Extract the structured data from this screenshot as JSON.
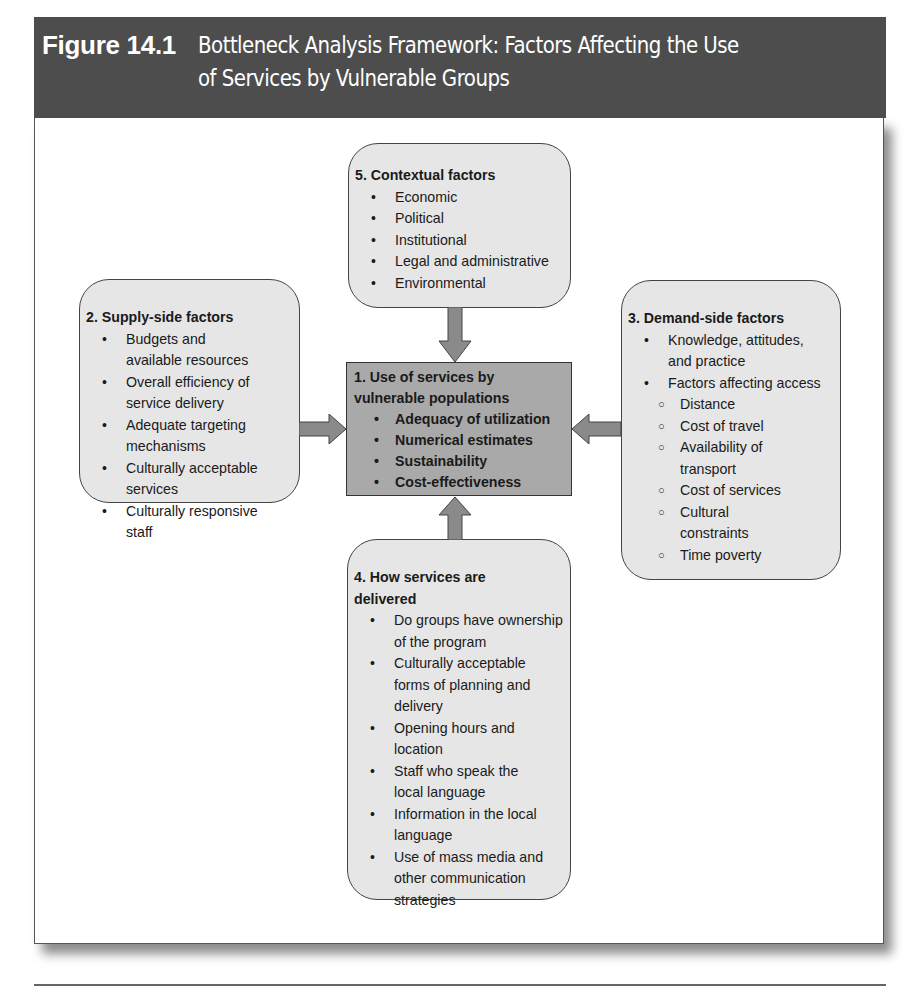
{
  "figure": {
    "label": "Figure 14.1",
    "title": "Bottleneck Analysis Framework: Factors Affecting the Use of Services by Vulnerable Groups",
    "title_line1": "Bottleneck Analysis Framework: Factors Affecting the Use",
    "title_line2": "of Services by Vulnerable Groups",
    "colors": {
      "header_bg": "#4d4d4d",
      "box_bg": "#e6e6e6",
      "center_bg": "#a9a9a9",
      "arrow_fill": "#8a8a8a",
      "border": "#444444"
    }
  },
  "nodes": {
    "center": {
      "heading": "1. Use of services by vulnerable populations",
      "heading_line1": "1. Use of services by",
      "heading_line2": "vulnerable populations",
      "items": [
        "Adequacy of utilization",
        "Numerical estimates",
        "Sustainability",
        "Cost-effectiveness"
      ]
    },
    "supply": {
      "heading": "2. Supply-side factors",
      "items": [
        "Budgets and available resources",
        "Overall efficiency of service delivery",
        "Adequate targeting mechanisms",
        "Culturally acceptable services",
        "Culturally responsive staff"
      ]
    },
    "demand": {
      "heading": "3. Demand-side factors",
      "items": [
        "Knowledge, attitudes, and practice",
        "Factors affecting access"
      ],
      "access_subitems": [
        "Distance",
        "Cost of travel",
        "Availability of transport",
        "Cost of services",
        "Cultural constraints",
        "Time poverty"
      ]
    },
    "delivery": {
      "heading": "4. How services are delivered",
      "items": [
        "Do groups have ownership of the program",
        "Culturally acceptable forms of planning and delivery",
        "Opening hours and location",
        "Staff who speak the local language",
        "Information in the local language",
        "Use of mass media and other communication strategies"
      ]
    },
    "contextual": {
      "heading": "5. Contextual factors",
      "items": [
        "Economic",
        "Political",
        "Institutional",
        "Legal and administrative",
        "Environmental"
      ]
    }
  },
  "edges": [
    {
      "from": "5. Contextual factors",
      "to": "1. Use of services by vulnerable populations",
      "direction": "down"
    },
    {
      "from": "2. Supply-side factors",
      "to": "1. Use of services by vulnerable populations",
      "direction": "right"
    },
    {
      "from": "3. Demand-side factors",
      "to": "1. Use of services by vulnerable populations",
      "direction": "left"
    },
    {
      "from": "4. How services are delivered",
      "to": "1. Use of services by vulnerable populations",
      "direction": "up"
    }
  ]
}
